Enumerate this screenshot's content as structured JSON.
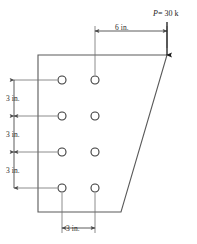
{
  "figure": {
    "type": "engineering-diagram",
    "colors": {
      "plate_outline": "#5a5a5a",
      "dimension_line": "#4a4a4a",
      "hole_outline": "#3a3a3a",
      "text": "#2b2b2b",
      "load_arrow": "#1c1c1c",
      "background": "#ffffff"
    }
  },
  "load": {
    "label": "P = 30 k",
    "symbol": "P",
    "equals": "=",
    "magnitude": "30",
    "unit": "k",
    "direction": "down"
  },
  "dimensions": {
    "eccentricity": {
      "label": "6 in.",
      "value": 6,
      "unit": "in.",
      "orientation": "horizontal"
    },
    "vertical_spacings": [
      {
        "label": "3 in.",
        "value": 3,
        "unit": "in."
      },
      {
        "label": "3 in.",
        "value": 3,
        "unit": "in."
      },
      {
        "label": "3 in.",
        "value": 3,
        "unit": "in."
      }
    ],
    "horizontal_spacing": {
      "label": "3 in.",
      "value": 3,
      "unit": "in.",
      "orientation": "horizontal"
    }
  },
  "plate": {
    "shape": "trapezoid",
    "vertices": [
      {
        "x": 38,
        "y": 55
      },
      {
        "x": 167,
        "y": 55
      },
      {
        "x": 121,
        "y": 212
      },
      {
        "x": 38,
        "y": 212
      }
    ]
  },
  "holes": {
    "count": 8,
    "columns": 2,
    "rows": 4,
    "radius": 4,
    "centers": [
      {
        "x": 62,
        "y": 80
      },
      {
        "x": 95,
        "y": 80
      },
      {
        "x": 62,
        "y": 116
      },
      {
        "x": 95,
        "y": 116
      },
      {
        "x": 62,
        "y": 152
      },
      {
        "x": 95,
        "y": 152
      },
      {
        "x": 62,
        "y": 188
      },
      {
        "x": 95,
        "y": 188
      }
    ]
  }
}
